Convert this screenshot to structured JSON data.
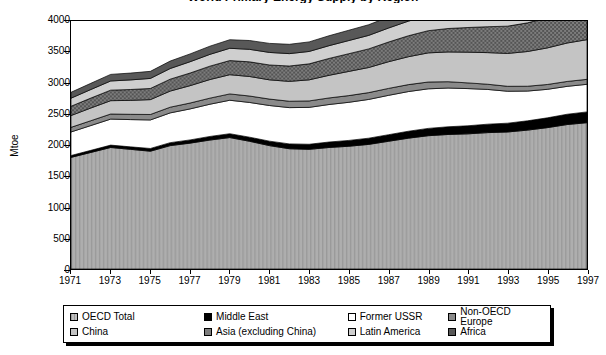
{
  "chart_data": {
    "type": "area",
    "title": "World Primary Energy Supply by Region",
    "title_clipped": true,
    "xlabel": "",
    "ylabel": "Mtoe",
    "ylim": [
      0,
      4000
    ],
    "ytick_step": 500,
    "yticks": [
      "0",
      "500",
      "1000",
      "1500",
      "2000",
      "2500",
      "3000",
      "3500",
      "4000"
    ],
    "x": [
      1971,
      1972,
      1973,
      1974,
      1975,
      1976,
      1977,
      1978,
      1979,
      1980,
      1981,
      1982,
      1983,
      1984,
      1985,
      1986,
      1987,
      1988,
      1989,
      1990,
      1991,
      1992,
      1993,
      1994,
      1995,
      1996,
      1997
    ],
    "xticks": [
      "1971",
      "1973",
      "1975",
      "1977",
      "1979",
      "1981",
      "1983",
      "1985",
      "1987",
      "1989",
      "1991",
      "1993",
      "1995",
      "1997"
    ],
    "grid": false,
    "legend_position": "bottom",
    "stacked": true,
    "series": [
      {
        "name": "OECD Total",
        "color": "#a8a8a8",
        "pattern": "vertical-stripes",
        "values": [
          1800,
          1880,
          1960,
          1930,
          1900,
          1990,
          2030,
          2080,
          2120,
          2060,
          1990,
          1940,
          1930,
          1960,
          1980,
          2010,
          2060,
          2110,
          2150,
          2170,
          2180,
          2200,
          2210,
          2240,
          2280,
          2330,
          2360
        ]
      },
      {
        "name": "Middle East",
        "color": "#000000",
        "pattern": "solid",
        "values": [
          30,
          34,
          38,
          40,
          44,
          48,
          52,
          58,
          62,
          66,
          72,
          78,
          82,
          88,
          94,
          100,
          106,
          112,
          118,
          124,
          130,
          136,
          142,
          150,
          158,
          166,
          174
        ]
      },
      {
        "name": "Former USSR",
        "color": "#ffffff",
        "pattern": "solid",
        "values": [
          380,
          400,
          420,
          440,
          460,
          480,
          500,
          520,
          540,
          560,
          575,
          585,
          595,
          605,
          615,
          625,
          635,
          640,
          638,
          625,
          600,
          560,
          515,
          480,
          460,
          450,
          445
        ]
      },
      {
        "name": "Non-OECD Europe",
        "color": "#8a8a8a",
        "pattern": "solid",
        "values": [
          75,
          78,
          82,
          85,
          88,
          92,
          95,
          98,
          102,
          104,
          104,
          103,
          104,
          106,
          108,
          110,
          112,
          112,
          110,
          102,
          92,
          84,
          80,
          78,
          78,
          79,
          80
        ]
      },
      {
        "name": "China",
        "color": "#c4c4c4",
        "pattern": "solid",
        "values": [
          190,
          205,
          215,
          225,
          240,
          260,
          280,
          300,
          310,
          315,
          310,
          320,
          340,
          365,
          390,
          405,
          430,
          450,
          470,
          480,
          495,
          510,
          530,
          560,
          590,
          620,
          640
        ]
      },
      {
        "name": "Asia (excluding China)",
        "color": "#707070",
        "pattern": "cross-hatch",
        "values": [
          150,
          160,
          170,
          175,
          180,
          192,
          204,
          216,
          228,
          236,
          240,
          248,
          258,
          272,
          286,
          300,
          318,
          338,
          358,
          378,
          398,
          418,
          440,
          462,
          486,
          510,
          530
        ]
      },
      {
        "name": "Latin America",
        "color": "#cfcfcf",
        "pattern": "solid",
        "values": [
          130,
          138,
          148,
          155,
          162,
          172,
          182,
          190,
          198,
          202,
          202,
          200,
          200,
          206,
          212,
          218,
          226,
          236,
          244,
          252,
          260,
          270,
          280,
          292,
          304,
          316,
          326
        ]
      },
      {
        "name": "Africa",
        "color": "#585858",
        "pattern": "solid",
        "values": [
          95,
          100,
          106,
          110,
          114,
          120,
          126,
          132,
          138,
          142,
          146,
          150,
          154,
          160,
          166,
          172,
          178,
          186,
          192,
          198,
          204,
          210,
          218,
          226,
          234,
          242,
          250
        ]
      }
    ]
  },
  "legend": {
    "items": [
      {
        "label": "OECD Total"
      },
      {
        "label": "Middle East"
      },
      {
        "label": "Former USSR"
      },
      {
        "label": "Non-OECD Europe"
      },
      {
        "label": "China"
      },
      {
        "label": "Asia (excluding China)"
      },
      {
        "label": "Latin America"
      },
      {
        "label": "Africa"
      }
    ]
  }
}
